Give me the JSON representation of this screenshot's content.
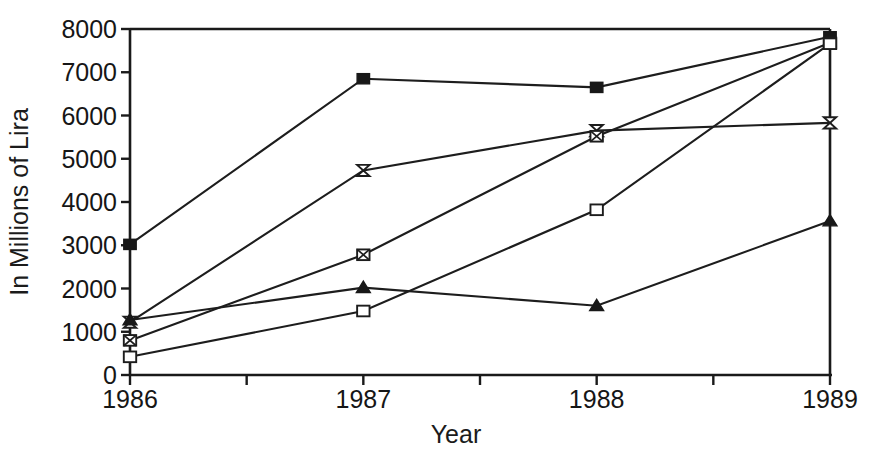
{
  "chart_data": {
    "type": "line",
    "title": "",
    "xlabel": "Year",
    "ylabel": "In Millions of Lira",
    "categories": [
      "1986",
      "1987",
      "1988",
      "1989"
    ],
    "x": [
      1986,
      1987,
      1988,
      1989
    ],
    "xlim": [
      1986,
      1989
    ],
    "ylim": [
      0,
      8000
    ],
    "ytick_labels": [
      "0",
      "1000",
      "2000",
      "3000",
      "4000",
      "5000",
      "6000",
      "7000",
      "8000"
    ],
    "yticks": [
      0,
      1000,
      2000,
      3000,
      4000,
      5000,
      6000,
      7000,
      8000
    ],
    "xtick_labels": [
      "1986",
      "1987",
      "1988",
      "1989"
    ],
    "grid": false,
    "legend": "none",
    "series": [
      {
        "name": "series-1",
        "marker": "filled-square",
        "values": [
          3020,
          6850,
          6650,
          7820
        ]
      },
      {
        "name": "series-2",
        "marker": "bowtie",
        "values": [
          1220,
          4730,
          5650,
          5830
        ]
      },
      {
        "name": "series-3",
        "marker": "crossed-square",
        "values": [
          800,
          2780,
          5520,
          7680
        ]
      },
      {
        "name": "series-4",
        "marker": "filled-triangle",
        "values": [
          1270,
          2020,
          1600,
          3560
        ]
      },
      {
        "name": "series-5",
        "marker": "open-square",
        "values": [
          420,
          1480,
          3820,
          7660
        ]
      }
    ]
  },
  "axes": {
    "y_axis_title": "In Millions of Lira",
    "x_axis_title": "Year"
  }
}
